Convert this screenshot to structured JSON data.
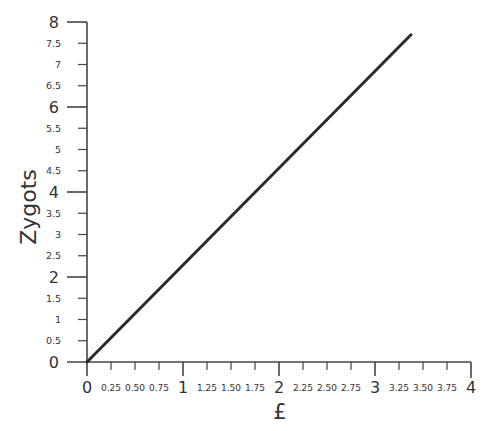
{
  "chart_data": {
    "type": "line",
    "title": "",
    "xlabel": "£",
    "ylabel": "Zygots",
    "xlim": [
      0,
      4
    ],
    "ylim": [
      0,
      8
    ],
    "x_major_ticks": [
      {
        "value": 0,
        "label": "0"
      },
      {
        "value": 1,
        "label": "1"
      },
      {
        "value": 2,
        "label": "2"
      },
      {
        "value": 3,
        "label": "3"
      },
      {
        "value": 4,
        "label": "4"
      }
    ],
    "x_minor_ticks": [
      {
        "value": 0.25,
        "label": "0.25"
      },
      {
        "value": 0.5,
        "label": "0.50"
      },
      {
        "value": 0.75,
        "label": "0.75"
      },
      {
        "value": 1.25,
        "label": "1.25"
      },
      {
        "value": 1.5,
        "label": "1.50"
      },
      {
        "value": 1.75,
        "label": "1.75"
      },
      {
        "value": 2.25,
        "label": "2.25"
      },
      {
        "value": 2.5,
        "label": "2.50"
      },
      {
        "value": 2.75,
        "label": "2.75"
      },
      {
        "value": 3.25,
        "label": "3.25"
      },
      {
        "value": 3.5,
        "label": "3.50"
      },
      {
        "value": 3.75,
        "label": "3.75"
      }
    ],
    "y_major_ticks": [
      {
        "value": 0,
        "label": "0"
      },
      {
        "value": 2,
        "label": "2"
      },
      {
        "value": 4,
        "label": "4"
      },
      {
        "value": 6,
        "label": "6"
      },
      {
        "value": 8,
        "label": "8"
      }
    ],
    "y_minor_ticks": [
      {
        "value": 0.5,
        "label": "0.5"
      },
      {
        "value": 1,
        "label": "1"
      },
      {
        "value": 1.5,
        "label": "1.5"
      },
      {
        "value": 2.5,
        "label": "2.5"
      },
      {
        "value": 3,
        "label": "3"
      },
      {
        "value": 3.5,
        "label": "3.5"
      },
      {
        "value": 4.5,
        "label": "4.5"
      },
      {
        "value": 5,
        "label": "5"
      },
      {
        "value": 5.5,
        "label": "5.5"
      },
      {
        "value": 6.5,
        "label": "6.5"
      },
      {
        "value": 7,
        "label": "7"
      },
      {
        "value": 7.5,
        "label": "7.5"
      }
    ],
    "grid": false,
    "legend": null,
    "series": [
      {
        "name": "Zygots per £",
        "color": "#2b2b2b",
        "x": [
          0,
          3.375
        ],
        "y": [
          0,
          7.7
        ]
      }
    ]
  }
}
